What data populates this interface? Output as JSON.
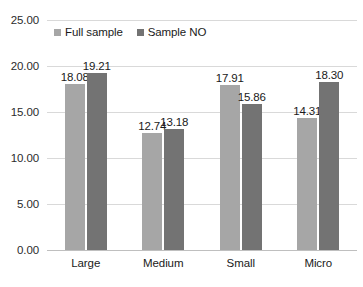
{
  "chart_data": {
    "type": "bar",
    "title": "",
    "subtitle": "",
    "xlabel": "",
    "ylabel": "",
    "categories": [
      "Large",
      "Medium",
      "Small",
      "Micro"
    ],
    "series": [
      {
        "name": "Full sample",
        "color": "#a6a6a6",
        "values": [
          18.08,
          12.74,
          17.91,
          14.31
        ]
      },
      {
        "name": "Sample NO",
        "color": "#737373",
        "values": [
          19.21,
          13.18,
          15.86,
          18.3
        ]
      }
    ],
    "value_labels": [
      [
        "18.08",
        "12.74",
        "17.91",
        "14.31"
      ],
      [
        "19.21",
        "13.18",
        "15.86",
        "18.30"
      ]
    ],
    "ylim": [
      0,
      25
    ],
    "ytick_step": 5,
    "ytick_labels": [
      "25.00",
      "20.00",
      "15.00",
      "10.00",
      "5.00",
      "0.00"
    ],
    "ytick_values": [
      25,
      20,
      15,
      10,
      5,
      0
    ],
    "grid": true,
    "grid_color": "#d9d9d9",
    "legend_position": "top-left-inside",
    "background": "#ffffff"
  }
}
